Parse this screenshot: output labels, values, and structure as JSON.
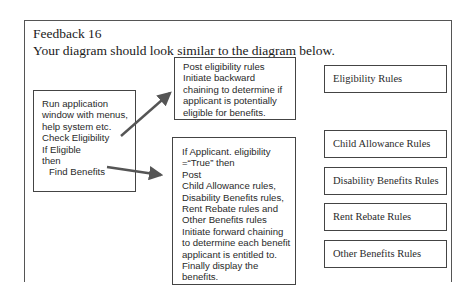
{
  "heading": {
    "title": "Feedback 16",
    "subtitle": "Your diagram should look similar to the diagram below."
  },
  "left_box": {
    "lines": [
      "Run application",
      "window with menus,",
      "help system etc.",
      "Check Eligibility",
      "If Eligible",
      "then",
      "Find Benefits"
    ]
  },
  "top_box": {
    "lines": [
      "Post eligibility rules",
      "Initiate backward",
      "chaining to determine if",
      "applicant is potentially",
      "eligible for benefits."
    ]
  },
  "main_box": {
    "lines": [
      "If Applicant. eligibility",
      "=“True” then",
      "Post",
      "Child Allowance rules,",
      "Disability Benefits rules,",
      "Rent Rebate rules and",
      "Other Benefits rules",
      "Initiate forward chaining",
      "to determine each benefit",
      "applicant is entitled to.",
      "Finally display the",
      "benefits."
    ]
  },
  "rule_boxes": [
    {
      "label": "Eligibility Rules"
    },
    {
      "label": "Child Allowance Rules"
    },
    {
      "label": "Disability Benefits Rules"
    },
    {
      "label": "Rent Rebate Rules"
    },
    {
      "label": "Other Benefits Rules"
    }
  ],
  "arrows": [
    {
      "from": "left_box",
      "to": "top_box"
    },
    {
      "from": "left_box",
      "to": "main_box"
    }
  ],
  "colors": {
    "stroke": "#444444",
    "arrow": "#555555",
    "text": "#2a2a2a"
  }
}
